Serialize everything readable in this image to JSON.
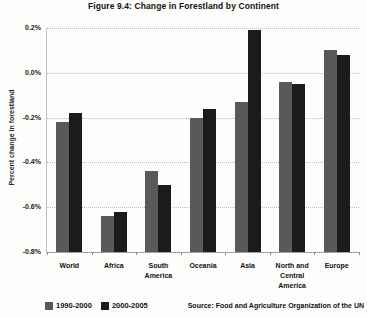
{
  "title": "Figure 9.4: Change in Forestland by Continent",
  "source": "Source: Food and Agriculture Organization of the UN",
  "chart_data": {
    "type": "bar",
    "title": "Figure 9.4: Change in Forestland by Continent",
    "xlabel": "",
    "ylabel": "Percent change in forestland",
    "categories": [
      "World",
      "Africa",
      "South\nAmerica",
      "Oceania",
      "Asia",
      "North and\nCentral\nAmerica",
      "Europe"
    ],
    "series": [
      {
        "name": "1990-2000",
        "color": "#595959",
        "values": [
          -0.22,
          -0.64,
          -0.44,
          -0.2,
          -0.13,
          -0.04,
          0.1
        ]
      },
      {
        "name": "2000-2005",
        "color": "#1b1b1b",
        "values": [
          -0.18,
          -0.62,
          -0.5,
          -0.16,
          0.19,
          -0.05,
          0.08
        ]
      }
    ],
    "y_ticks": [
      0.2,
      0.0,
      -0.2,
      -0.4,
      -0.6,
      -0.8
    ],
    "y_tick_labels": [
      "0.2%",
      "0.0%",
      "-0.2%",
      "-0.4%",
      "-0.6%",
      "-0.8%"
    ],
    "ylim": [
      -0.8,
      0.2
    ],
    "bar_baseline": -0.8,
    "grid": true,
    "legend_position": "bottom-left",
    "colors": {
      "series1": "#595959",
      "series2": "#1b1b1b",
      "gridline": "#bdbdbd",
      "axis": "#8a8a8a",
      "text": "#111111"
    }
  }
}
